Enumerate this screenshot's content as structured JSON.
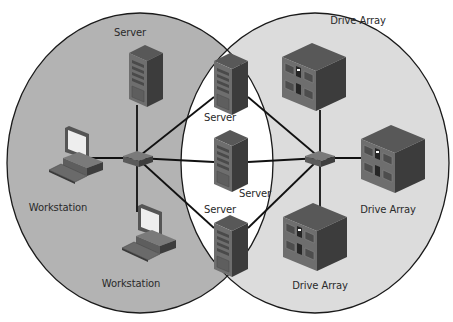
{
  "diagram": {
    "type": "network-topology",
    "colors": {
      "left_zone": "#b3b3b3",
      "right_zone": "#dcdcdc",
      "overlap_zone": "#ffffff",
      "outline": "#1a1a1a",
      "link": "#111111",
      "device_front": "#6e6e6e",
      "device_side": "#3c3c3c",
      "device_top": "#585858",
      "label_text": "#2a2a2a"
    },
    "zones": [
      {
        "id": "left-network",
        "cx": 140,
        "cy": 163,
        "rx": 133,
        "ry": 150
      },
      {
        "id": "right-network",
        "cx": 315,
        "cy": 163,
        "rx": 134,
        "ry": 150
      }
    ],
    "switches": [
      {
        "id": "switch-left",
        "x": 138,
        "y": 158
      },
      {
        "id": "switch-right",
        "x": 320,
        "y": 158
      }
    ],
    "nodes": [
      {
        "id": "server-top-left",
        "type": "server",
        "label": "Server",
        "x": 129,
        "y": 45,
        "label_x": 130,
        "label_y": 27
      },
      {
        "id": "server-top-mid",
        "type": "server",
        "label": "Server",
        "x": 214,
        "y": 53,
        "label_x": 220,
        "label_y": 112
      },
      {
        "id": "server-mid",
        "type": "server",
        "label": "Server",
        "x": 214,
        "y": 130,
        "label_x": 255,
        "label_y": 188
      },
      {
        "id": "server-bottom-mid",
        "type": "server",
        "label": "Server",
        "x": 214,
        "y": 215,
        "label_x": 220,
        "label_y": 204
      },
      {
        "id": "workstation-left",
        "type": "workstation",
        "label": "Workstation",
        "x": 57,
        "y": 128,
        "label_x": 58,
        "label_y": 202
      },
      {
        "id": "workstation-bottom",
        "type": "workstation",
        "label": "Workstation",
        "x": 130,
        "y": 206,
        "label_x": 131,
        "label_y": 278
      },
      {
        "id": "drive-array-top",
        "type": "drive-array",
        "label": "Drive Array",
        "x": 282,
        "y": 43,
        "label_x": 358,
        "label_y": 15
      },
      {
        "id": "drive-array-right",
        "type": "drive-array",
        "label": "Drive Array",
        "x": 361,
        "y": 125,
        "label_x": 388,
        "label_y": 204
      },
      {
        "id": "drive-array-bottom",
        "type": "drive-array",
        "label": "Drive Array",
        "x": 283,
        "y": 203,
        "label_x": 320,
        "label_y": 280
      }
    ],
    "links": [
      {
        "from": "switch-left",
        "to": "server-top-left",
        "x1": 137,
        "y1": 158,
        "x2": 137,
        "y2": 105
      },
      {
        "from": "switch-left",
        "to": "workstation-left",
        "x1": 137,
        "y1": 158,
        "x2": 82,
        "y2": 158
      },
      {
        "from": "switch-left",
        "to": "workstation-bottom",
        "x1": 137,
        "y1": 158,
        "x2": 137,
        "y2": 212
      },
      {
        "from": "switch-left",
        "to": "server-top-mid",
        "x1": 137,
        "y1": 158,
        "x2": 214,
        "y2": 97
      },
      {
        "from": "switch-left",
        "to": "server-mid",
        "x1": 137,
        "y1": 158,
        "x2": 214,
        "y2": 162
      },
      {
        "from": "switch-left",
        "to": "server-bottom-mid",
        "x1": 137,
        "y1": 158,
        "x2": 214,
        "y2": 228
      },
      {
        "from": "switch-right",
        "to": "server-top-mid",
        "x1": 320,
        "y1": 158,
        "x2": 248,
        "y2": 97
      },
      {
        "from": "switch-right",
        "to": "server-mid",
        "x1": 320,
        "y1": 158,
        "x2": 248,
        "y2": 162
      },
      {
        "from": "switch-right",
        "to": "server-bottom-mid",
        "x1": 320,
        "y1": 158,
        "x2": 248,
        "y2": 228
      },
      {
        "from": "switch-right",
        "to": "drive-array-top",
        "x1": 320,
        "y1": 158,
        "x2": 320,
        "y2": 110
      },
      {
        "from": "switch-right",
        "to": "drive-array-right",
        "x1": 320,
        "y1": 158,
        "x2": 362,
        "y2": 158
      },
      {
        "from": "switch-right",
        "to": "drive-array-bottom",
        "x1": 320,
        "y1": 158,
        "x2": 320,
        "y2": 210
      }
    ]
  }
}
